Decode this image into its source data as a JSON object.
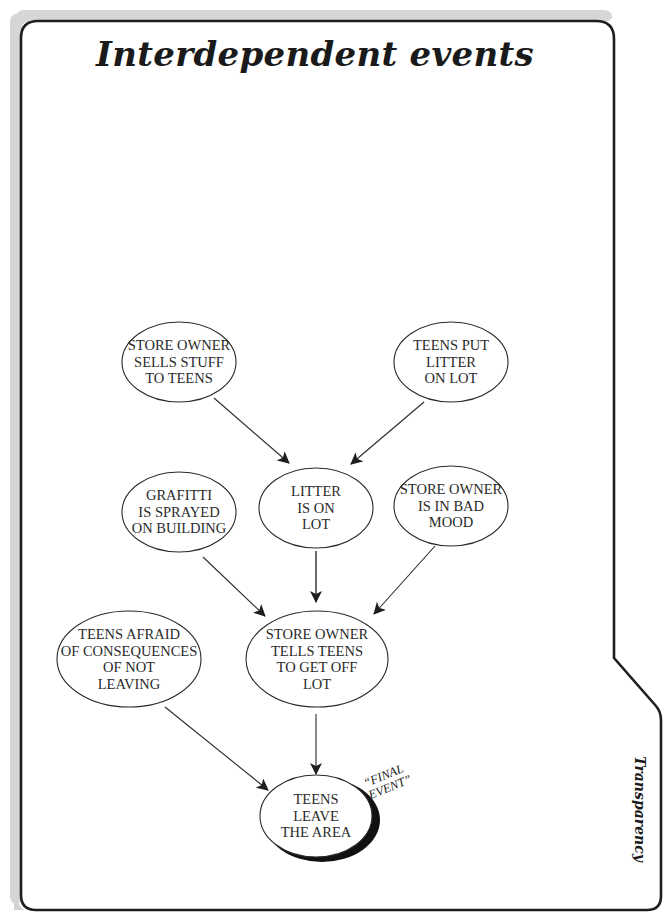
{
  "page": {
    "title": "Interdependent events",
    "side_tab_label": "Transparency",
    "annotation": "“FINAL\nEVENT”"
  },
  "diagram": {
    "nodes": [
      {
        "id": "store-owner-sells",
        "label": "STORE OWNER\nSELLS STUFF\nTO TEENS"
      },
      {
        "id": "teens-put-litter",
        "label": "TEENS PUT\nLITTER\nON LOT"
      },
      {
        "id": "grafitti",
        "label": "GRAFITTI\nIS SPRAYED\nON BUILDING"
      },
      {
        "id": "litter-on-lot",
        "label": "LITTER\nIS ON\nLOT"
      },
      {
        "id": "bad-mood",
        "label": "STORE OWNER\nIS IN BAD\nMOOD"
      },
      {
        "id": "teens-afraid",
        "label": "TEENS AFRAID\nOF CONSEQUENCES\nOF NOT\nLEAVING"
      },
      {
        "id": "tells-teens",
        "label": "STORE OWNER\nTELLS TEENS\nTO GET OFF\nLOT"
      },
      {
        "id": "teens-leave",
        "label": "TEENS\nLEAVE\nTHE AREA"
      }
    ],
    "edges": [
      {
        "from": "store-owner-sells",
        "to": "litter-on-lot"
      },
      {
        "from": "teens-put-litter",
        "to": "litter-on-lot"
      },
      {
        "from": "grafitti",
        "to": "tells-teens"
      },
      {
        "from": "litter-on-lot",
        "to": "tells-teens"
      },
      {
        "from": "bad-mood",
        "to": "tells-teens"
      },
      {
        "from": "teens-afraid",
        "to": "teens-leave"
      },
      {
        "from": "tells-teens",
        "to": "teens-leave"
      }
    ],
    "final_event": "teens-leave"
  },
  "colors": {
    "frame_stroke": "#1e1e1e",
    "frame_shadow": "#cfcfcf",
    "text": "#2a2a2a",
    "background": "#ffffff"
  }
}
